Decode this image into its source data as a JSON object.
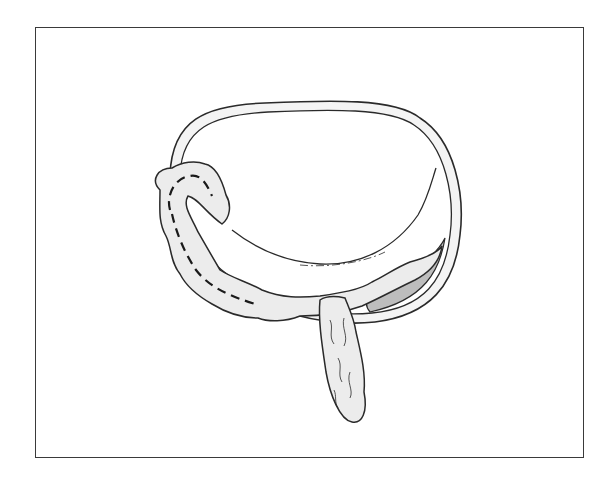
{
  "figure": {
    "type": "anatomical line illustration",
    "labels": [],
    "colors": {
      "outline": "#2a2a2a",
      "fill_light": "#ececec",
      "fill_shaded": "#bdbdbd",
      "background": "#ffffff",
      "frame": "#3a3a3a"
    }
  }
}
